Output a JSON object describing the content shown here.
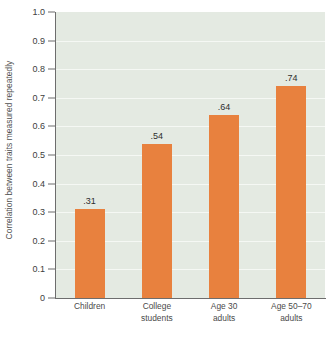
{
  "chart_data": {
    "type": "bar",
    "title": "",
    "subtitle": "",
    "xlabel": "",
    "ylabel": "Correlation between traits measured repeatedly",
    "categories": [
      "Children",
      "College students",
      "Age 30 adults",
      "Age 50–70 adults"
    ],
    "category_lines": [
      [
        "Children"
      ],
      [
        "College",
        "students"
      ],
      [
        "Age 30",
        "adults"
      ],
      [
        "Age 50–70",
        "adults"
      ]
    ],
    "values": [
      0.31,
      0.54,
      0.64,
      0.74
    ],
    "data_labels": [
      ".31",
      ".54",
      ".64",
      ".74"
    ],
    "ylim": [
      0,
      1.0
    ],
    "ytick_values": [
      0,
      0.1,
      0.2,
      0.3,
      0.4,
      0.5,
      0.6,
      0.7,
      0.8,
      0.9,
      1.0
    ],
    "ytick_labels": [
      "0",
      "0.1",
      "0.2",
      "0.3",
      "0.4",
      "0.5",
      "0.6",
      "0.7",
      "0.8",
      "0.9",
      "1.0"
    ],
    "grid": true,
    "grid_orientation": "horizontal",
    "legend": false,
    "legend_position": "none",
    "colors": {
      "bar": "#e8813e",
      "plot_background": "#e4eae2",
      "gridline": "#f5f8f4",
      "axis": "#6d6d6d",
      "tick_label": "#3d3d3d",
      "category_label": "#4a4a4a",
      "data_label": "#2e2e2e",
      "axis_title": "#4f4f4f",
      "figure_background": "#ffffff"
    }
  }
}
